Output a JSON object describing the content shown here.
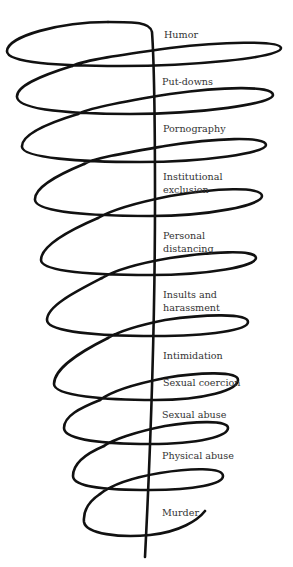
{
  "diagram": {
    "type": "continuum-spiral",
    "line_color": "#111111",
    "text_color": "#333333",
    "levels": [
      {
        "id": "humor",
        "lines": [
          "Humor"
        ]
      },
      {
        "id": "put-downs",
        "lines": [
          "Put-downs"
        ]
      },
      {
        "id": "pornography",
        "lines": [
          "Pornography"
        ]
      },
      {
        "id": "institutional-exclusion",
        "lines": [
          "Institutional",
          "exclusion"
        ]
      },
      {
        "id": "personal-distancing",
        "lines": [
          "Personal",
          "distancing"
        ]
      },
      {
        "id": "insults-harassment",
        "lines": [
          "Insults and",
          "harassment"
        ]
      },
      {
        "id": "intimidation",
        "lines": [
          "Intimidation"
        ]
      },
      {
        "id": "sexual-coercion",
        "lines": [
          "Sexual coercion"
        ]
      },
      {
        "id": "sexual-abuse",
        "lines": [
          "Sexual abuse"
        ]
      },
      {
        "id": "physical-abuse",
        "lines": [
          "Physical abuse"
        ]
      },
      {
        "id": "murder",
        "lines": [
          "Murder"
        ]
      }
    ]
  }
}
